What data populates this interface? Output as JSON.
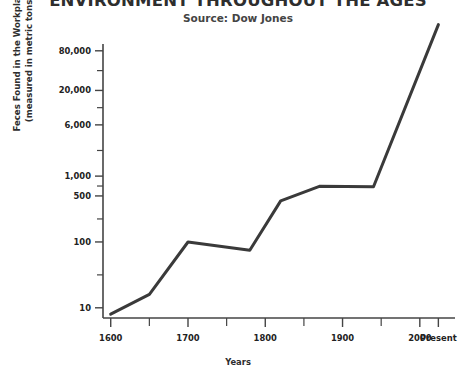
{
  "chart_data": {
    "type": "line",
    "title": "ENVIRONMENT THROUGHOUT THE AGES",
    "subtitle": "Source: Dow Jones",
    "xlabel": "Years",
    "ylabel_line1": "Feces Found in the Workplace",
    "ylabel_line2": "(measured in metric tons)",
    "yscale": "log",
    "grid": false,
    "legend": "none",
    "line_color": "#3a3a3a",
    "axis_color": "#444444",
    "background_color": "#ffffff",
    "x_tick_labels": [
      "1600",
      "1700",
      "1800",
      "1900",
      "2000",
      "Present"
    ],
    "x_tick_values": [
      1600,
      1700,
      1800,
      1900,
      2000,
      2024
    ],
    "x_minor_tick_values": [
      1650,
      1750,
      1850,
      1950
    ],
    "xlim": [
      1590,
      2030
    ],
    "y_tick_labels": [
      "10",
      "100",
      "500",
      "1,000",
      "6,000",
      "20,000",
      "80,000"
    ],
    "y_tick_values": [
      10,
      100,
      500,
      1000,
      6000,
      20000,
      80000
    ],
    "ylim": [
      7,
      300000
    ],
    "series": [
      {
        "name": "Feces Found in the Workplace",
        "x": [
          1600,
          1650,
          1700,
          1780,
          1820,
          1870,
          1940,
          2024
        ],
        "values": [
          8,
          16,
          100,
          75,
          420,
          700,
          690,
          200000
        ]
      }
    ]
  }
}
